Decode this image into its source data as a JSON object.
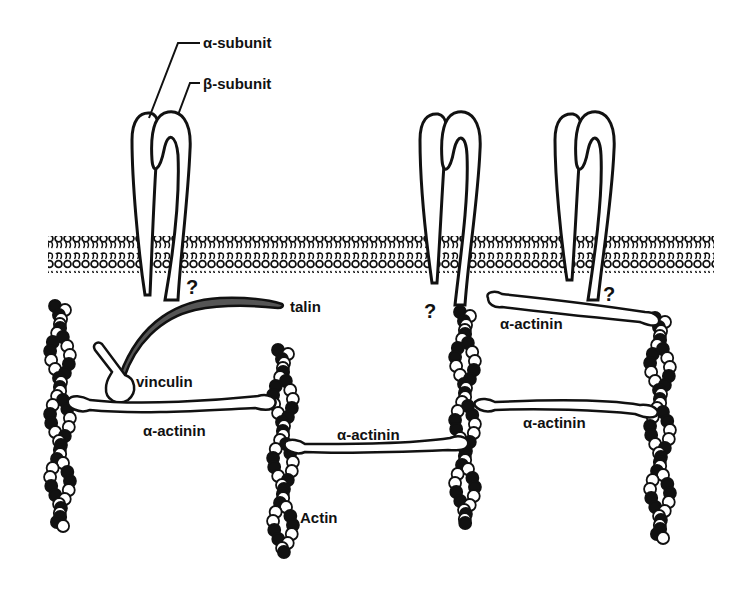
{
  "diagram": {
    "labels": {
      "alpha_subunit": "α-subunit",
      "beta_subunit": "β-subunit",
      "talin": "talin",
      "vinculin": "vinculin",
      "actinin_1": "α-actinin",
      "actinin_2": "α-actinin",
      "actinin_3": "α-actinin",
      "actinin_4": "α-actinin",
      "actin": "Actin",
      "question_1": "?",
      "question_2": "?",
      "question_3": "?"
    },
    "colors": {
      "ink": "#111111",
      "background": "#ffffff",
      "talin_fill": "#555555",
      "actin_light": "#ffffff",
      "actin_dark": "#111111"
    }
  }
}
